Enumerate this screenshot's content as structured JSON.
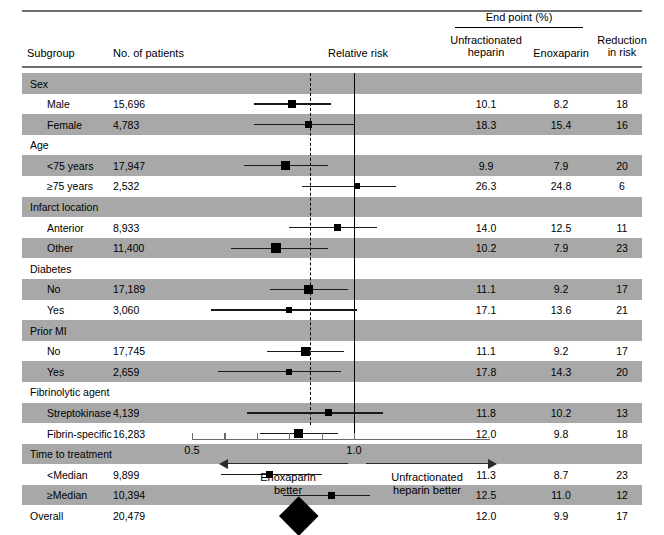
{
  "header": {
    "endpoint_title": "End point (%)",
    "col_subgroup": "Subgroup",
    "col_patients": "No. of patients",
    "col_relative_risk": "Relative risk",
    "col_ufh": "Unfractionated\nheparin",
    "col_ufh_line1": "Unfractionated",
    "col_ufh_line2": "heparin",
    "col_enoxaparin": "Enoxaparin",
    "col_reduction_line1": "Reduction",
    "col_reduction_line2": "in risk"
  },
  "axis": {
    "tick_low": "0.5",
    "tick_high": "1.0",
    "left_caption_line1": "Enoxaparin",
    "left_caption_line2": "better",
    "right_caption_line1": "Unfractionated",
    "right_caption_line2": "heparin better"
  },
  "chart_data": {
    "type": "forest",
    "xlabel": "Relative risk",
    "xlim": [
      0.5,
      1.1
    ],
    "xticks": [
      0.5,
      0.6,
      0.7,
      0.8,
      0.9,
      1.0
    ],
    "xtick_labels": [
      "0.5",
      "",
      "",
      "",
      "",
      "1.0"
    ],
    "reference_line": 1.0,
    "pooled_line": 0.83,
    "columns": [
      "Subgroup",
      "No. of patients",
      "Relative risk",
      "Unfractionated heparin",
      "Enoxaparin",
      "Reduction in risk"
    ],
    "rows": [
      {
        "kind": "group",
        "label": "Sex",
        "patients": "",
        "ufh": "",
        "enox": "",
        "reduction": "",
        "shade": true
      },
      {
        "kind": "item",
        "label": "Male",
        "patients": "15,696",
        "ufh": "10.1",
        "enox": "8.2",
        "reduction": "18",
        "shade": false,
        "rr": 0.81,
        "ci_low": 0.69,
        "ci_high": 0.93,
        "marker": 8
      },
      {
        "kind": "item",
        "label": "Female",
        "patients": "4,783",
        "ufh": "18.3",
        "enox": "15.4",
        "reduction": "16",
        "shade": true,
        "rr": 0.86,
        "ci_low": 0.69,
        "ci_high": 1.0,
        "marker": 7
      },
      {
        "kind": "group",
        "label": "Age",
        "patients": "",
        "ufh": "",
        "enox": "",
        "reduction": "",
        "shade": false
      },
      {
        "kind": "item",
        "label": "<75 years",
        "patients": "17,947",
        "ufh": "9.9",
        "enox": "7.9",
        "reduction": "20",
        "shade": true,
        "rr": 0.79,
        "ci_low": 0.66,
        "ci_high": 0.92,
        "marker": 9
      },
      {
        "kind": "item",
        "label": "≥75 years",
        "patients": "2,532",
        "ufh": "26.3",
        "enox": "24.8",
        "reduction": "6",
        "shade": false,
        "rr": 1.01,
        "ci_low": 0.84,
        "ci_high": 1.13,
        "marker": 6
      },
      {
        "kind": "group",
        "label": "Infarct location",
        "patients": "",
        "ufh": "",
        "enox": "",
        "reduction": "",
        "shade": true
      },
      {
        "kind": "item",
        "label": "Anterior",
        "patients": "8,933",
        "ufh": "14.0",
        "enox": "12.5",
        "reduction": "11",
        "shade": false,
        "rr": 0.95,
        "ci_low": 0.8,
        "ci_high": 1.07,
        "marker": 7
      },
      {
        "kind": "item",
        "label": "Other",
        "patients": "11,400",
        "ufh": "10.2",
        "enox": "7.9",
        "reduction": "23",
        "shade": true,
        "rr": 0.76,
        "ci_low": 0.62,
        "ci_high": 0.92,
        "marker": 10
      },
      {
        "kind": "group",
        "label": "Diabetes",
        "patients": "",
        "ufh": "",
        "enox": "",
        "reduction": "",
        "shade": false
      },
      {
        "kind": "item",
        "label": "No",
        "patients": "17,189",
        "ufh": "11.1",
        "enox": "9.2",
        "reduction": "17",
        "shade": true,
        "rr": 0.86,
        "ci_low": 0.74,
        "ci_high": 0.98,
        "marker": 9
      },
      {
        "kind": "item",
        "label": "Yes",
        "patients": "3,060",
        "ufh": "17.1",
        "enox": "13.6",
        "reduction": "21",
        "shade": false,
        "rr": 0.8,
        "ci_low": 0.56,
        "ci_high": 1.01,
        "marker": 6
      },
      {
        "kind": "group",
        "label": "Prior MI",
        "patients": "",
        "ufh": "",
        "enox": "",
        "reduction": "",
        "shade": true
      },
      {
        "kind": "item",
        "label": "No",
        "patients": "17,745",
        "ufh": "11.1",
        "enox": "9.2",
        "reduction": "17",
        "shade": false,
        "rr": 0.85,
        "ci_low": 0.73,
        "ci_high": 0.97,
        "marker": 9
      },
      {
        "kind": "item",
        "label": "Yes",
        "patients": "2,659",
        "ufh": "17.8",
        "enox": "14.3",
        "reduction": "20",
        "shade": true,
        "rr": 0.8,
        "ci_low": 0.58,
        "ci_high": 0.96,
        "marker": 6
      },
      {
        "kind": "group",
        "label": "Fibrinolytic agent",
        "patients": "",
        "ufh": "",
        "enox": "",
        "reduction": "",
        "shade": false
      },
      {
        "kind": "item",
        "label": "Streptokinase",
        "patients": "4,139",
        "ufh": "11.8",
        "enox": "10.2",
        "reduction": "13",
        "shade": true,
        "rr": 0.92,
        "ci_low": 0.67,
        "ci_high": 1.09,
        "marker": 7
      },
      {
        "kind": "item",
        "label": "Fibrin-specific",
        "patients": "16,283",
        "ufh": "12.0",
        "enox": "9.8",
        "reduction": "18",
        "shade": false,
        "rr": 0.83,
        "ci_low": 0.71,
        "ci_high": 0.95,
        "marker": 9
      },
      {
        "kind": "group",
        "label": "Time to treatment",
        "patients": "",
        "ufh": "",
        "enox": "",
        "reduction": "",
        "shade": true
      },
      {
        "kind": "item",
        "label": "<Median",
        "patients": "9,899",
        "ufh": "11.3",
        "enox": "8.7",
        "reduction": "23",
        "shade": false,
        "rr": 0.74,
        "ci_low": 0.59,
        "ci_high": 0.9,
        "marker": 7
      },
      {
        "kind": "item",
        "label": "≥Median",
        "patients": "10,394",
        "ufh": "12.5",
        "enox": "11.0",
        "reduction": "12",
        "shade": true,
        "rr": 0.93,
        "ci_low": 0.78,
        "ci_high": 1.05,
        "marker": 7
      },
      {
        "kind": "total",
        "label": "Overall",
        "patients": "20,479",
        "ufh": "12.0",
        "enox": "9.9",
        "reduction": "17",
        "shade": false,
        "rr": 0.83,
        "ci_low": 0.75,
        "ci_high": 0.92,
        "diamond": true
      }
    ]
  }
}
